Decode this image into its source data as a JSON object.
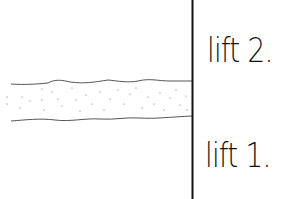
{
  "diagram": {
    "type": "hand-drawn geological/layer sketch",
    "labels": {
      "upper": "lift 2.",
      "lower": "lift 1."
    },
    "elements": {
      "divider": "vertical line",
      "band": "dotted horizontal band with wavy edges"
    },
    "colors": {
      "ink": "#111111",
      "band_edge": "#555555",
      "background": "#ffffff"
    }
  }
}
